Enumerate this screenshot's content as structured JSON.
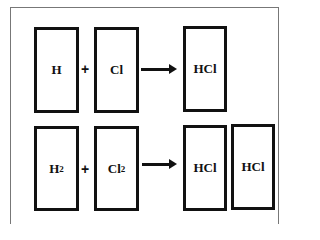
{
  "diagram": {
    "title": "",
    "rows": [
      {
        "reactants": [
          {
            "symbol": "H",
            "sub": ""
          },
          {
            "symbol": "Cl",
            "sub": ""
          }
        ],
        "operator": "+",
        "arrow": "→",
        "products": [
          {
            "symbol": "HCl",
            "sub": ""
          }
        ]
      },
      {
        "reactants": [
          {
            "symbol": "H",
            "sub": "2"
          },
          {
            "symbol": "Cl",
            "sub": "2"
          }
        ],
        "operator": "+",
        "arrow": "→",
        "products": [
          {
            "symbol": "HCl",
            "sub": ""
          },
          {
            "symbol": "HCl",
            "sub": ""
          }
        ]
      }
    ],
    "colors": {
      "stroke": "#111111",
      "frame": "#777777",
      "background": "#ffffff"
    }
  }
}
